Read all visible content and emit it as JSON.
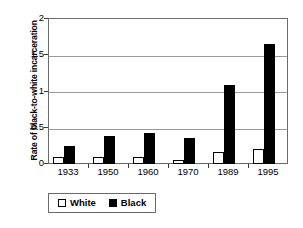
{
  "chart_data": {
    "type": "bar",
    "title": "",
    "xlabel": "",
    "ylabel": "Rate of black-to-white incarceration",
    "categories": [
      "1933",
      "1950",
      "1960",
      "1970",
      "1989",
      "1995"
    ],
    "series": [
      {
        "name": "White",
        "values": [
          0.09,
          0.09,
          0.09,
          0.06,
          0.16,
          0.21
        ],
        "color": "#ffffff"
      },
      {
        "name": "Black",
        "values": [
          0.25,
          0.38,
          0.43,
          0.36,
          1.08,
          1.64
        ],
        "color": "#000000"
      }
    ],
    "ylim": [
      0,
      2
    ],
    "yticks": [
      "0",
      "0.5",
      "1",
      "1.5",
      "2"
    ],
    "ytick_values": [
      0,
      0.5,
      1,
      1.5,
      2
    ],
    "grid": true,
    "legend_position": "bottom"
  },
  "legend": {
    "entries": [
      {
        "label": "White",
        "swatch": "white-square-icon"
      },
      {
        "label": "Black",
        "swatch": "black-square-icon"
      }
    ]
  }
}
